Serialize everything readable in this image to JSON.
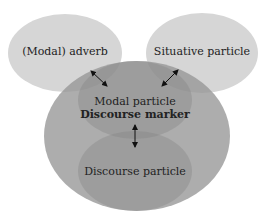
{
  "diagram": {
    "nodes": [
      {
        "id": "modal-adverb",
        "label": "(Modal) adverb",
        "color": "#d6d6d6"
      },
      {
        "id": "situative-particle",
        "label": "Situative particle",
        "color": "#d6d6d6"
      },
      {
        "id": "outer-circle",
        "label": "",
        "color": "#ababab"
      },
      {
        "id": "modal-particle",
        "label": "Modal particle",
        "color": "#9c9c9c"
      },
      {
        "id": "discourse-marker",
        "label": "Discourse marker",
        "color": "#9c9c9c"
      },
      {
        "id": "discourse-particle",
        "label": "Discourse particle",
        "color": "#9c9c9c"
      }
    ],
    "edges": [
      {
        "from": "modal-adverb",
        "to": "modal-particle",
        "type": "bidirectional"
      },
      {
        "from": "situative-particle",
        "to": "modal-particle",
        "type": "bidirectional"
      },
      {
        "from": "discourse-marker",
        "to": "discourse-particle",
        "type": "bidirectional"
      }
    ]
  }
}
